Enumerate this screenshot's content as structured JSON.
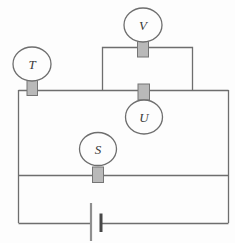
{
  "diagram": {
    "kind": "electric-circuit-diagram",
    "meters": [
      {
        "id": "v",
        "label": "V"
      },
      {
        "id": "t",
        "label": "T"
      },
      {
        "id": "u",
        "label": "U"
      },
      {
        "id": "s",
        "label": "S"
      }
    ],
    "battery": {
      "name": "battery-cell",
      "plates": [
        "long-thin",
        "short-thick"
      ]
    },
    "colors": {
      "wire": "#6e6e6e",
      "meter_fill": "#fdfdfd",
      "connector_fill": "#b9b9b9",
      "connector_border": "#757575",
      "battery_long_plate": "#8f8f8f",
      "battery_short_plate": "#474747",
      "label_text": "#3a3a3a",
      "background": "#fdfdfd"
    }
  }
}
